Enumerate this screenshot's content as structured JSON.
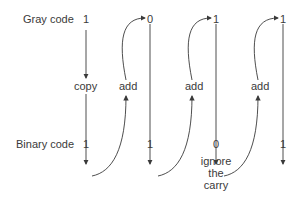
{
  "diagram": {
    "row_labels": {
      "gray": "Gray code",
      "binary": "Binary code"
    },
    "gray_bits": [
      "1",
      "0",
      "1",
      "1"
    ],
    "binary_bits": [
      "1",
      "1",
      "0",
      "1"
    ],
    "operations": [
      "copy",
      "add",
      "add",
      "add"
    ],
    "note": [
      "ignore",
      "the",
      "carry"
    ],
    "colors": {
      "line": "#3a3a3a",
      "text": "#3a3a3a",
      "background": "#ffffff"
    }
  }
}
